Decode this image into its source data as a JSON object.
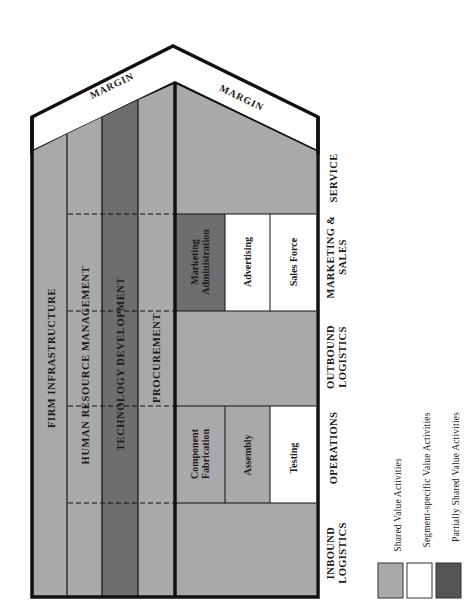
{
  "colors": {
    "shared": "#a9a9a9",
    "segment_specific": "#ffffff",
    "partially_shared": "#6e6e6e",
    "outline": "#111111"
  },
  "margin": {
    "left_label": "MARGIN",
    "right_label": "MARGIN"
  },
  "support_activities": [
    {
      "label": "FIRM INFRASTRUCTURE",
      "type": "shared"
    },
    {
      "label": "HUMAN RESOURCE MANAGEMENT",
      "type": "shared"
    },
    {
      "label": "TECHNOLOGY DEVELOPMENT",
      "type": "partially_shared"
    },
    {
      "label": "PROCUREMENT",
      "type": "shared"
    }
  ],
  "primary_activities": [
    {
      "label_line1": "INBOUND",
      "label_line2": "LOGISTICS"
    },
    {
      "label_line1": "OPERATIONS",
      "label_line2": ""
    },
    {
      "label_line1": "OUTBOUND",
      "label_line2": "LOGISTICS"
    },
    {
      "label_line1": "MARKETING &",
      "label_line2": "SALES"
    },
    {
      "label_line1": "SERVICE",
      "label_line2": ""
    }
  ],
  "operations_cells": [
    {
      "line1": "Component",
      "line2": "Fabrication",
      "type": "shared"
    },
    {
      "line1": "Assembly",
      "line2": "",
      "type": "shared"
    },
    {
      "line1": "Testing",
      "line2": "",
      "type": "segment_specific"
    }
  ],
  "marketing_cells": [
    {
      "line1": "Marketing",
      "line2": "Administration",
      "type": "partially_shared"
    },
    {
      "line1": "Advertising",
      "line2": "",
      "type": "segment_specific"
    },
    {
      "line1": "Sales Force",
      "line2": "",
      "type": "segment_specific"
    }
  ],
  "legend": [
    {
      "label": "Shared Value Activities",
      "type": "shared"
    },
    {
      "label": "Segment-specific Value Activities",
      "type": "segment_specific"
    },
    {
      "label": "Partially Shared Value Activities",
      "type": "partially_shared"
    }
  ]
}
